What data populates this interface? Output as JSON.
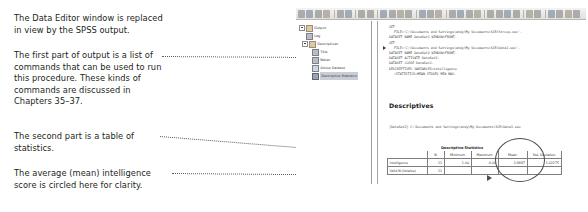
{
  "annotations": [
    {
      "name": "annotation-data-editor-replaced",
      "lines": [
        "The Data Editor window is replaced",
        "in view by the SPSS output."
      ]
    },
    {
      "name": "annotation-first-part-commands",
      "lines": [
        "The first part of output is a list of",
        "commands that can be used to run",
        "this procedure. These kinds of",
        "commands are discussed in",
        "Chapters 35–37."
      ]
    },
    {
      "name": "annotation-second-part-table",
      "lines": [
        "The second part is a table of",
        "statistics."
      ]
    },
    {
      "name": "annotation-mean-circled",
      "lines": [
        "The average (mean) intelligence",
        "score is circled here for clarity."
      ]
    }
  ],
  "spss": {
    "toolbar": {
      "icons": [
        "open-file-icon",
        "save-icon",
        "print-icon",
        "print-preview-icon",
        "export-icon",
        "recall-dialog-icon",
        "undo-icon",
        "redo-icon",
        "goto-data-icon",
        "goto-case-icon",
        "variables-icon",
        "find-icon",
        "insert-cases-icon",
        "insert-variable-icon",
        "split-file-icon",
        "weight-cases-icon",
        "select-cases-icon",
        "value-labels-icon",
        "use-sets-icon",
        "show-all-icon",
        "spell-check-icon",
        "promote-icon",
        "demote-icon",
        "expand-icon",
        "collapse-icon",
        "show-icon",
        "hide-icon",
        "insert-heading-icon",
        "insert-title-icon",
        "insert-text-icon",
        "help-icon"
      ]
    },
    "outline": {
      "items": [
        {
          "label": "Output",
          "icon": "output-folder-icon",
          "depth": 0,
          "toggle": true,
          "selected": false
        },
        {
          "label": "Log",
          "icon": "log-icon",
          "depth": 1,
          "toggle": false,
          "selected": false
        },
        {
          "label": "Descriptives",
          "icon": "descriptives-folder-icon",
          "depth": 1,
          "toggle": true,
          "selected": false
        },
        {
          "label": "Title",
          "icon": "title-icon",
          "depth": 2,
          "toggle": false,
          "selected": false
        },
        {
          "label": "Notes",
          "icon": "notes-icon",
          "depth": 2,
          "toggle": false,
          "selected": false
        },
        {
          "label": "Active Dataset",
          "icon": "dataset-icon",
          "depth": 2,
          "toggle": false,
          "selected": false
        },
        {
          "label": "Descriptive Statistics",
          "icon": "table-icon",
          "depth": 2,
          "toggle": false,
          "selected": true
        }
      ]
    },
    "viewer": {
      "syntax_lines": [
        {
          "text": "GET",
          "indent": false,
          "marker": false
        },
        {
          "text": "  FILE='C:\\Documents and Settings\\andy\\My Documents\\SCR\\Stroop.sav'.",
          "indent": true,
          "marker": false
        },
        {
          "text": "DATASET NAME DataSet1 WINDOW=FRONT.",
          "indent": false,
          "marker": false
        },
        {
          "text": "GET",
          "indent": false,
          "marker": false
        },
        {
          "text": "  FILE='C:\\Documents and Settings\\andy\\My Documents\\SCR\\Data1.sav'.",
          "indent": true,
          "marker": true
        },
        {
          "text": "DATASET NAME DataSet2 WINDOW=FRONT.",
          "indent": false,
          "marker": false
        },
        {
          "text": "DATASET ACTIVATE DataSet2.",
          "indent": false,
          "marker": false
        },
        {
          "text": "DATASET CLOSE DataSet1.",
          "indent": false,
          "marker": false
        },
        {
          "text": "DESCRIPTIVES VARIABLES=intelligence",
          "indent": false,
          "marker": false
        },
        {
          "text": "  /STATISTICS=MEAN STDDEV MIN MAX.",
          "indent": true,
          "marker": false
        }
      ],
      "heading": "Descriptives",
      "dataset_note": "[DataSet2] C:\\Documents and Settings\\andy\\My Documents\\SCR\\Data1.sav",
      "table": {
        "caption": "Descriptive Statistics",
        "columns": [
          "",
          "N",
          "Minimum",
          "Maximum",
          "Mean",
          "Std. Deviation"
        ],
        "rows": [
          [
            "Intelligence",
            "11",
            "1.00",
            "4.00",
            "2.8887",
            "1.02275"
          ],
          [
            "Valid N (listwise)",
            "11",
            "",
            "",
            "",
            ""
          ]
        ]
      }
    }
  }
}
